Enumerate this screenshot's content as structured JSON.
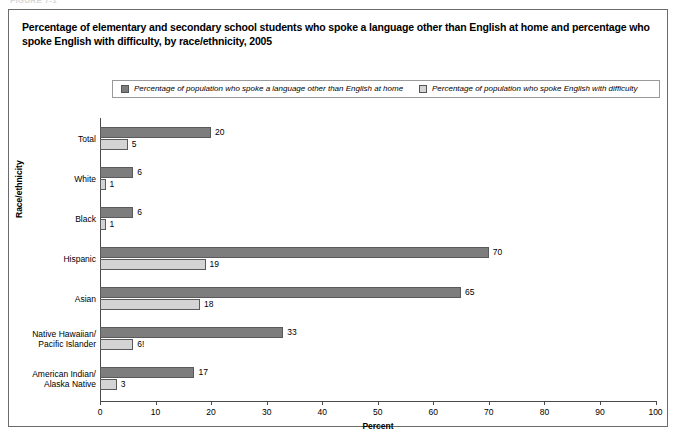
{
  "figure_tag": "FIGURE 7-1",
  "title": "Percentage of elementary and secondary school students who spoke a language other than English at home and percentage who spoke English with difficulty, by race/ethnicity, 2005",
  "legend": {
    "entries": [
      {
        "label": "Percentage of population who spoke a language other than English at home",
        "swatch": "dark-swatch-icon",
        "color": "#7d7d7d"
      },
      {
        "label": "Percentage of population who spoke English with difficulty",
        "swatch": "light-swatch-icon",
        "color": "#d4d4d4"
      }
    ]
  },
  "chart_data": {
    "type": "bar",
    "orientation": "horizontal",
    "title": "Percentage of elementary and secondary school students who spoke a language other than English at home and percentage who spoke English with difficulty, by race/ethnicity, 2005",
    "xlabel": "Percent",
    "ylabel": "Race/ethnicity",
    "xlim": [
      0,
      100
    ],
    "xticks": [
      0,
      10,
      20,
      30,
      40,
      50,
      60,
      70,
      80,
      90,
      100
    ],
    "grid": false,
    "legend_position": "top",
    "categories": [
      "Total",
      "White",
      "Black",
      "Hispanic",
      "Asian",
      "Native Hawaiian/ Pacific Islander",
      "American Indian/ Alaska Native"
    ],
    "category_lines": [
      [
        "Total"
      ],
      [
        "White"
      ],
      [
        "Black"
      ],
      [
        "Hispanic"
      ],
      [
        "Asian"
      ],
      [
        "Native Hawaiian/",
        "Pacific Islander"
      ],
      [
        "American Indian/",
        "Alaska Native"
      ]
    ],
    "series": [
      {
        "name": "Percentage of population who spoke a language other than English at home",
        "color": "#7d7d7d",
        "values": [
          20,
          6,
          6,
          70,
          65,
          33,
          17
        ],
        "labels": [
          "20",
          "6",
          "6",
          "70",
          "65",
          "33",
          "17"
        ]
      },
      {
        "name": "Percentage of population who spoke English with difficulty",
        "color": "#d4d4d4",
        "values": [
          5,
          1,
          1,
          19,
          18,
          6,
          3
        ],
        "labels": [
          "5",
          "1",
          "1",
          "19",
          "18",
          "6!",
          "3"
        ]
      }
    ],
    "annotations": [
      "! Interpret data with caution (Native Hawaiian/Pacific Islander, English with difficulty = 6!)"
    ]
  }
}
